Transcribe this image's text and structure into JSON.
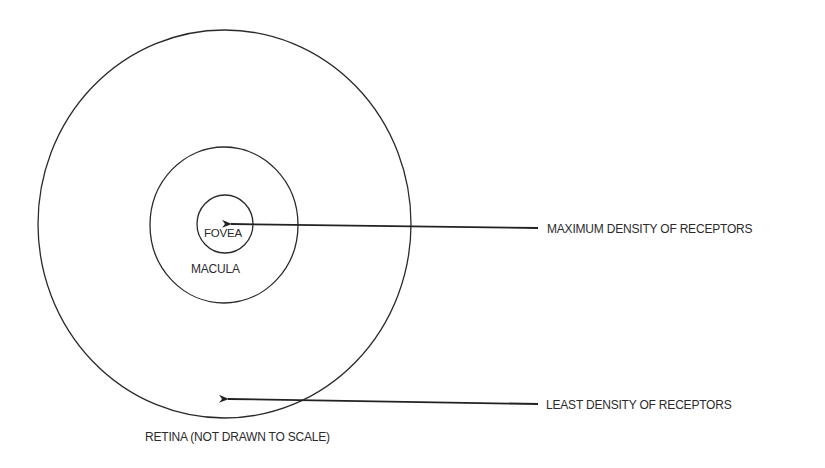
{
  "diagram": {
    "colors": {
      "background": "#ffffff",
      "stroke": "#2a2a2a",
      "text": "#2b2b2b"
    },
    "regions": [
      {
        "id": "retina",
        "label": "RETINA (NOT DRAWN TO SCALE)",
        "shape": "circle",
        "cx": 224.5,
        "cy": 224,
        "rx": 186.5,
        "ry": 194
      },
      {
        "id": "macula",
        "label": "MACULA",
        "shape": "circle",
        "cx": 224,
        "cy": 225,
        "rx": 74,
        "ry": 78
      },
      {
        "id": "fovea",
        "label": "FOVEA",
        "shape": "circle",
        "cx": 225,
        "cy": 224,
        "rx": 28,
        "ry": 29
      }
    ],
    "annotations": [
      {
        "id": "max",
        "label": "MAXIMUM DENSITY OF RECEPTORS",
        "arrow_from": [
          538,
          228
        ],
        "arrow_to": [
          229,
          224
        ],
        "points_to": "fovea"
      },
      {
        "id": "least",
        "label": "LEAST DENSITY OF RECEPTORS",
        "arrow_from": [
          538,
          404
        ],
        "arrow_to": [
          226,
          399
        ],
        "points_to": "retina periphery"
      }
    ]
  },
  "labels": {
    "fovea": "FOVEA",
    "macula": "MACULA",
    "retina": "RETINA (NOT DRAWN TO SCALE)",
    "max_density": "MAXIMUM DENSITY OF RECEPTORS",
    "least_density": "LEAST DENSITY OF RECEPTORS"
  }
}
